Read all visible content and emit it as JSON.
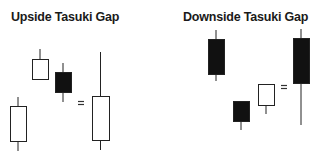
{
  "panels": [
    {
      "title": "Upside Tasuki Gap",
      "candles": [
        {
          "type": "bullish",
          "x": 10,
          "w": 16,
          "wick_top": 97,
          "body_top": 106,
          "body_bottom": 141,
          "wick_bottom": 151
        },
        {
          "type": "bullish",
          "x": 32,
          "w": 16,
          "wick_top": 49,
          "body_top": 59,
          "body_bottom": 79,
          "wick_bottom": 79
        },
        {
          "type": "bearish",
          "x": 55,
          "w": 16,
          "wick_top": 63,
          "body_top": 72,
          "body_bottom": 92,
          "wick_bottom": 102
        },
        {
          "type": "bullish",
          "x": 92,
          "w": 17,
          "wick_top": 52,
          "body_top": 96,
          "body_bottom": 140,
          "wick_bottom": 150
        }
      ],
      "equals": {
        "symbol": "=",
        "x": 78,
        "y": 101
      }
    },
    {
      "title": "Downside Tasuki Gap",
      "candles": [
        {
          "type": "bearish",
          "x": 208,
          "w": 16,
          "wick_top": 30,
          "body_top": 39,
          "body_bottom": 74,
          "wick_bottom": 81
        },
        {
          "type": "bearish",
          "x": 233,
          "w": 16,
          "wick_top": 101,
          "body_top": 101,
          "body_bottom": 121,
          "wick_bottom": 130
        },
        {
          "type": "bullish",
          "x": 258,
          "w": 16,
          "wick_top": 84,
          "body_top": 84,
          "body_bottom": 105,
          "wick_bottom": 114
        },
        {
          "type": "bearish",
          "x": 293,
          "w": 16,
          "wick_top": 29,
          "body_top": 38,
          "body_bottom": 83,
          "wick_bottom": 125
        }
      ],
      "equals": {
        "symbol": "=",
        "x": 281,
        "y": 85
      }
    }
  ],
  "colors": {
    "bullish_fill": "#ffffff",
    "bearish_fill": "#111111",
    "stroke": "#222222"
  }
}
